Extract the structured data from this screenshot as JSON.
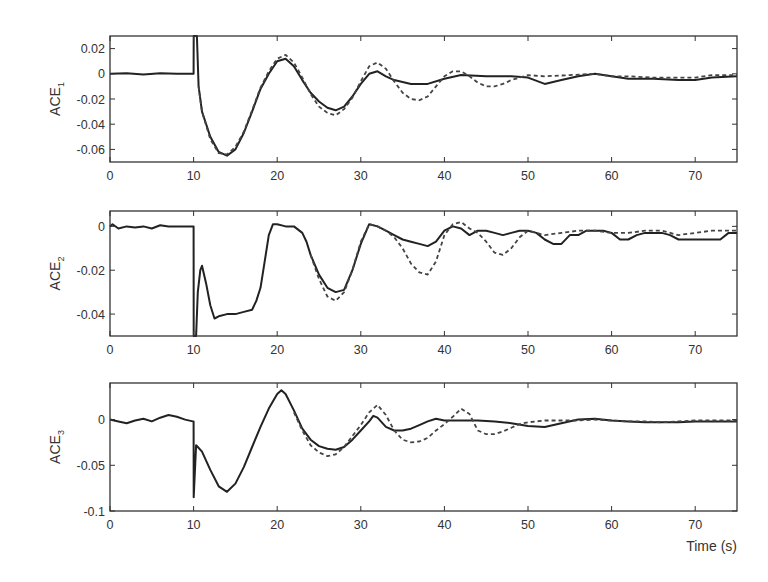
{
  "chart_data": [
    {
      "type": "line",
      "title": "",
      "xlabel": "",
      "ylabel": "ACE",
      "ylabel_sub": "1",
      "xlim": [
        0,
        75
      ],
      "ylim": [
        -0.07,
        0.03
      ],
      "xticks": [
        0,
        10,
        20,
        30,
        40,
        50,
        60,
        70
      ],
      "yticks": [
        0.02,
        0,
        -0.02,
        -0.04,
        -0.06
      ],
      "ytick_labels": [
        "0.02",
        "0",
        "-0.02",
        "-0.04",
        "-0.06"
      ],
      "grid": false,
      "legend": null,
      "box": {
        "left": 110,
        "top": 36,
        "right": 737,
        "bottom": 162
      },
      "series": [
        {
          "name": "solid",
          "style": "solid",
          "x": [
            0,
            2,
            4,
            6,
            8,
            10,
            10.01,
            10.4,
            10.6,
            11,
            12,
            13,
            14,
            15,
            16,
            17,
            18,
            19,
            20,
            21,
            22,
            23,
            24,
            25,
            26,
            27,
            28,
            29,
            30,
            31,
            32,
            33,
            34,
            36,
            38,
            40,
            42,
            45,
            48,
            50,
            52,
            54,
            56,
            58,
            60,
            62,
            65,
            68,
            70,
            72,
            75
          ],
          "y": [
            0,
            0.0005,
            -0.0005,
            0.0005,
            0,
            0,
            0.03,
            0.03,
            -0.01,
            -0.03,
            -0.05,
            -0.062,
            -0.065,
            -0.06,
            -0.047,
            -0.03,
            -0.012,
            0,
            0.01,
            0.012,
            0.006,
            -0.005,
            -0.015,
            -0.022,
            -0.027,
            -0.029,
            -0.026,
            -0.018,
            -0.008,
            0,
            0.002,
            -0.002,
            -0.005,
            -0.008,
            -0.008,
            -0.004,
            -0.001,
            -0.002,
            -0.002,
            -0.003,
            -0.008,
            -0.005,
            -0.002,
            0,
            -0.002,
            -0.004,
            -0.004,
            -0.005,
            -0.005,
            -0.003,
            -0.002
          ]
        },
        {
          "name": "dashed",
          "style": "dashed",
          "x": [
            10.6,
            11,
            12,
            13,
            14,
            15,
            16,
            17,
            18,
            19,
            20,
            21,
            22,
            23,
            24,
            25,
            26,
            27,
            28,
            29,
            30,
            31,
            32,
            33,
            34,
            35,
            36,
            37,
            38,
            39,
            40,
            41,
            42,
            43,
            44,
            45,
            46,
            47,
            48,
            49,
            50,
            52,
            55,
            58,
            60,
            62,
            65,
            68,
            70,
            72,
            75
          ],
          "y": [
            -0.01,
            -0.03,
            -0.052,
            -0.063,
            -0.064,
            -0.058,
            -0.046,
            -0.029,
            -0.011,
            0.002,
            0.012,
            0.015,
            0.009,
            -0.003,
            -0.016,
            -0.026,
            -0.031,
            -0.033,
            -0.028,
            -0.019,
            -0.006,
            0.006,
            0.009,
            0.004,
            -0.006,
            -0.015,
            -0.02,
            -0.021,
            -0.018,
            -0.01,
            -0.002,
            0.002,
            0.002,
            -0.002,
            -0.007,
            -0.01,
            -0.01,
            -0.008,
            -0.005,
            -0.003,
            -0.001,
            -0.002,
            -0.001,
            0,
            -0.002,
            -0.002,
            -0.003,
            -0.003,
            -0.003,
            -0.001,
            -0.001
          ]
        }
      ]
    },
    {
      "type": "line",
      "title": "",
      "xlabel": "",
      "ylabel": "ACE",
      "ylabel_sub": "2",
      "xlim": [
        0,
        75
      ],
      "ylim": [
        -0.05,
        0.007
      ],
      "xticks": [
        0,
        10,
        20,
        30,
        40,
        50,
        60,
        70
      ],
      "yticks": [
        0,
        -0.02,
        -0.04
      ],
      "ytick_labels": [
        "0",
        "-0.02",
        "-0.04"
      ],
      "grid": false,
      "legend": null,
      "box": {
        "left": 110,
        "top": 211,
        "right": 737,
        "bottom": 336
      },
      "series": [
        {
          "name": "solid",
          "style": "solid",
          "x": [
            0,
            0.3,
            1,
            2,
            3,
            4,
            5,
            6,
            7,
            8,
            9,
            9.9,
            10,
            10.01,
            10.3,
            10.5,
            10.8,
            11,
            11.5,
            12,
            12.5,
            13,
            14,
            15,
            16,
            17,
            17.5,
            18,
            18.5,
            19,
            19.5,
            20,
            21,
            22,
            23,
            23.5,
            24,
            25,
            26,
            27,
            28,
            29,
            30,
            31,
            32,
            33,
            34,
            35,
            36,
            37,
            38,
            39,
            40,
            41,
            42,
            43,
            44,
            45,
            46,
            47,
            48,
            49,
            50,
            51,
            52,
            53,
            54,
            55,
            56,
            57,
            58,
            59,
            60,
            61,
            62,
            63,
            64,
            65,
            66,
            67,
            68,
            69,
            70,
            71,
            72,
            73,
            74,
            75
          ],
          "y": [
            0,
            0.001,
            -0.001,
            0,
            -0.0005,
            0,
            -0.001,
            0.0005,
            0,
            0,
            0,
            0,
            0,
            -0.05,
            -0.05,
            -0.03,
            -0.02,
            -0.018,
            -0.026,
            -0.036,
            -0.042,
            -0.041,
            -0.04,
            -0.04,
            -0.039,
            -0.038,
            -0.034,
            -0.028,
            -0.016,
            -0.004,
            0.001,
            0.001,
            0,
            0,
            -0.003,
            -0.007,
            -0.013,
            -0.022,
            -0.028,
            -0.03,
            -0.029,
            -0.02,
            -0.008,
            0.001,
            0,
            -0.002,
            -0.004,
            -0.006,
            -0.007,
            -0.008,
            -0.009,
            -0.007,
            -0.002,
            0,
            -0.001,
            -0.004,
            -0.002,
            -0.002,
            -0.003,
            -0.004,
            -0.003,
            -0.002,
            -0.002,
            -0.003,
            -0.006,
            -0.008,
            -0.008,
            -0.004,
            -0.004,
            -0.002,
            -0.002,
            -0.002,
            -0.003,
            -0.006,
            -0.006,
            -0.004,
            -0.003,
            -0.003,
            -0.003,
            -0.004,
            -0.006,
            -0.006,
            -0.006,
            -0.006,
            -0.006,
            -0.006,
            -0.003,
            -0.003,
            -0.003,
            -0.003
          ]
        },
        {
          "name": "dashed",
          "style": "dashed",
          "x": [
            24,
            25,
            26,
            27,
            28,
            29,
            30,
            31,
            32,
            33,
            34,
            35,
            36,
            37,
            38,
            39,
            40,
            41,
            42,
            43,
            44,
            45,
            46,
            47,
            48,
            49,
            50,
            52,
            54,
            56,
            58,
            60,
            62,
            64,
            66,
            68,
            70,
            72,
            75
          ],
          "y": [
            -0.013,
            -0.024,
            -0.032,
            -0.034,
            -0.03,
            -0.02,
            -0.007,
            0.001,
            0,
            -0.002,
            -0.005,
            -0.01,
            -0.017,
            -0.021,
            -0.022,
            -0.016,
            -0.004,
            0.001,
            0.002,
            -0.001,
            -0.003,
            -0.007,
            -0.012,
            -0.013,
            -0.01,
            -0.005,
            -0.002,
            -0.004,
            -0.003,
            -0.002,
            -0.002,
            -0.003,
            -0.003,
            -0.002,
            -0.002,
            -0.004,
            -0.003,
            -0.002,
            -0.002
          ]
        }
      ]
    },
    {
      "type": "line",
      "title": "",
      "xlabel": "Time (s)",
      "ylabel": "ACE",
      "ylabel_sub": "3",
      "xlim": [
        0,
        75
      ],
      "ylim": [
        -0.1,
        0.04
      ],
      "xticks": [
        0,
        10,
        20,
        30,
        40,
        50,
        60,
        70
      ],
      "yticks": [
        0,
        -0.05,
        -0.1
      ],
      "ytick_labels": [
        "0",
        "-0.05",
        "-0.1"
      ],
      "grid": false,
      "legend": null,
      "box": {
        "left": 110,
        "top": 383,
        "right": 737,
        "bottom": 511
      },
      "series": [
        {
          "name": "solid",
          "style": "solid",
          "x": [
            0,
            1,
            2,
            3,
            4,
            5,
            6,
            7,
            8,
            9,
            9.9,
            10,
            10.01,
            10.3,
            10.5,
            11,
            12,
            13,
            14,
            15,
            16,
            17,
            18,
            19,
            20,
            20.5,
            21,
            22,
            23,
            24,
            25,
            26,
            27,
            28,
            29,
            30,
            31,
            31.5,
            32,
            33,
            34,
            35,
            36,
            37,
            38,
            39,
            40,
            41,
            42,
            44,
            46,
            48,
            50,
            52,
            54,
            56,
            58,
            60,
            62,
            64,
            66,
            68,
            70,
            72,
            75
          ],
          "y": [
            0,
            -0.002,
            -0.004,
            -0.001,
            0.001,
            -0.002,
            0.002,
            0.005,
            0.003,
            0,
            -0.002,
            -0.002,
            -0.085,
            -0.028,
            -0.03,
            -0.035,
            -0.055,
            -0.073,
            -0.079,
            -0.07,
            -0.052,
            -0.03,
            -0.008,
            0.012,
            0.028,
            0.032,
            0.028,
            0.01,
            -0.01,
            -0.022,
            -0.029,
            -0.032,
            -0.033,
            -0.03,
            -0.022,
            -0.012,
            -0.002,
            0.004,
            0.002,
            -0.008,
            -0.012,
            -0.012,
            -0.01,
            -0.006,
            -0.002,
            0.001,
            -0.001,
            -0.001,
            -0.001,
            -0.001,
            -0.002,
            -0.004,
            -0.007,
            -0.008,
            -0.004,
            0,
            0.001,
            -0.001,
            -0.002,
            -0.003,
            -0.003,
            -0.003,
            -0.002,
            -0.002,
            -0.002
          ]
        },
        {
          "name": "dashed",
          "style": "dashed",
          "x": [
            22,
            23,
            24,
            25,
            26,
            27,
            28,
            29,
            30,
            31,
            32,
            33,
            34,
            35,
            36,
            37,
            38,
            39,
            40,
            41,
            42,
            43,
            44,
            45,
            46,
            47,
            48,
            49,
            50,
            52,
            54,
            56,
            58,
            60,
            62,
            64,
            66,
            68,
            70,
            72,
            75
          ],
          "y": [
            0.008,
            -0.012,
            -0.028,
            -0.036,
            -0.04,
            -0.038,
            -0.03,
            -0.018,
            -0.006,
            0.008,
            0.016,
            0.005,
            -0.012,
            -0.022,
            -0.025,
            -0.024,
            -0.02,
            -0.012,
            -0.005,
            0.003,
            0.012,
            0.006,
            -0.012,
            -0.016,
            -0.016,
            -0.013,
            -0.009,
            -0.005,
            -0.003,
            -0.001,
            -0.001,
            -0.001,
            0,
            -0.001,
            -0.002,
            -0.002,
            -0.003,
            -0.002,
            -0.001,
            -0.001,
            -0.001
          ]
        }
      ]
    }
  ]
}
